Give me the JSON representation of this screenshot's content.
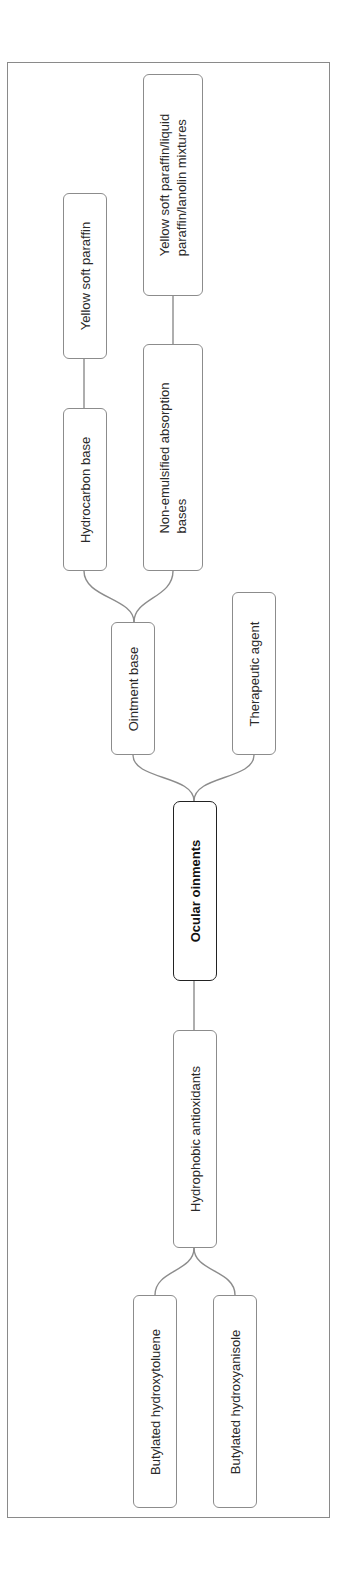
{
  "diagram": {
    "type": "mind-map",
    "orientation": "rotated-90",
    "root": {
      "id": "root",
      "label": "Ocular oinments"
    },
    "nodes": {
      "ointment_base": {
        "label": "Ointment base"
      },
      "therapeutic_agent": {
        "label": "Therapeutic agent"
      },
      "hydrocarbon_base": {
        "label": "Hydrocarbon base"
      },
      "yellow_soft_paraffin": {
        "label": "Yellow soft paraffin"
      },
      "non_emulsified": {
        "line1": "Non-emulsified absorption",
        "line2": "bases"
      },
      "mixtures": {
        "line1": "Yellow soft paraffin/liquid",
        "line2": "paraffin/lanolin mixtures"
      },
      "hydrophobic_antioxidants": {
        "label": "Hydrophobic antioxidants"
      },
      "bht": {
        "label": "Butylated hydroxytoluene"
      },
      "bha": {
        "label": "Butylated hydroxyanisole"
      }
    },
    "edges": [
      [
        "root",
        "ointment_base"
      ],
      [
        "root",
        "therapeutic_agent"
      ],
      [
        "root",
        "hydrophobic_antioxidants"
      ],
      [
        "ointment_base",
        "hydrocarbon_base"
      ],
      [
        "ointment_base",
        "non_emulsified"
      ],
      [
        "hydrocarbon_base",
        "yellow_soft_paraffin"
      ],
      [
        "non_emulsified",
        "mixtures"
      ],
      [
        "hydrophobic_antioxidants",
        "bht"
      ],
      [
        "hydrophobic_antioxidants",
        "bha"
      ]
    ],
    "colors": {
      "line": "#8c8c8c",
      "root_border": "#222222",
      "frame": "#8a8a8a"
    }
  }
}
